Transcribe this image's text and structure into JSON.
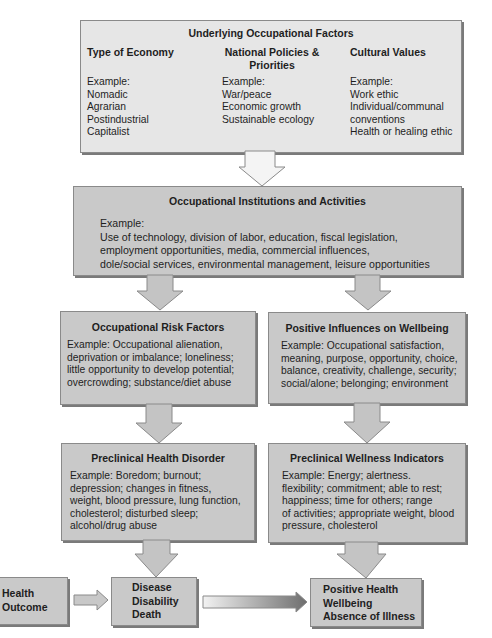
{
  "diagram": {
    "underlying": {
      "title": "Underlying Occupational Factors",
      "columns": [
        {
          "heading": "Type of Economy",
          "example_label": "Example:",
          "items": [
            "Nomadic",
            "Agrarian",
            "Postindustrial",
            "Capitalist"
          ]
        },
        {
          "heading_line1": "National Policies &",
          "heading_line2": "Priorities",
          "example_label": "Example:",
          "items": [
            "War/peace",
            "Economic growth",
            "Sustainable ecology"
          ]
        },
        {
          "heading": "Cultural Values",
          "example_label": "Example:",
          "items": [
            "Work ethic",
            "Individual/communal",
            "conventions",
            "Health or healing ethic"
          ]
        }
      ]
    },
    "institutions": {
      "title": "Occupational Institutions and Activities",
      "example_label": "Example:",
      "lines": [
        "Use of technology, division of labor, education, fiscal legislation,",
        "employment opportunities, media, commercial influences,",
        "dole/social services, environmental management, leisure opportunities"
      ]
    },
    "risk_factors": {
      "title": "Occupational Risk Factors",
      "lines": [
        "Example: Occupational alienation,",
        "deprivation or imbalance; loneliness;",
        "little opportunity to develop potential;",
        "overcrowding; substance/diet abuse"
      ]
    },
    "positive_influences": {
      "title": "Positive Influences on Wellbeing",
      "lines": [
        "Example: Occupational satisfaction,",
        "meaning, purpose, opportunity, choice,",
        "balance, creativity, challenge, security;",
        "social/alone; belonging; environment"
      ]
    },
    "preclinical_disorder": {
      "title": "Preclinical Health Disorder",
      "lines": [
        "Example: Boredom; burnout;",
        "depression; changes in fitness,",
        "weight, blood pressure, lung function,",
        "cholesterol; disturbed sleep;",
        "alcohol/drug abuse"
      ]
    },
    "preclinical_wellness": {
      "title": "Preclinical Wellness Indicators",
      "lines": [
        "Example: Energy; alertness.",
        "flexibility; commitment; able to rest;",
        "happiness; time for others; range",
        "of activities; appropriate weight, blood",
        "pressure, cholesterol"
      ]
    },
    "health_outcome": {
      "lines": [
        "Health",
        "Outcome"
      ]
    },
    "negative_outcome": {
      "lines": [
        "Disease",
        "Disability",
        "Death"
      ]
    },
    "positive_outcome": {
      "lines": [
        "Positive Health",
        "Wellbeing",
        "Absence of Illness"
      ]
    },
    "colors": {
      "box_fill": "#c9c9c9",
      "top_box_fill": "#e6e6e6",
      "arrow_fill": "#c4c4c4",
      "top_arrow_fill": "#f4f4f4",
      "gradient_start": "#f2f2f2",
      "gradient_end": "#6e6e6e"
    }
  }
}
